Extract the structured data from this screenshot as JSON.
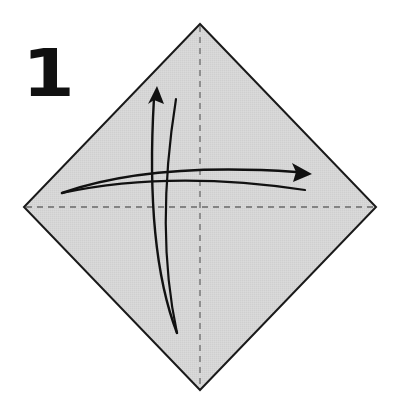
{
  "diagram": {
    "step_number": "1",
    "paper": {
      "shape": "square-diamond",
      "fill": "#d4d4d4",
      "outline": "#1a1a1a",
      "corners": {
        "top": [
          200,
          24
        ],
        "left": [
          24,
          207
        ],
        "right": [
          376,
          207
        ],
        "bottom": [
          200,
          390
        ]
      }
    },
    "creases": [
      {
        "name": "vertical-crease",
        "style": "dashed",
        "color": "#666666",
        "from": [
          200,
          24
        ],
        "to": [
          200,
          390
        ]
      },
      {
        "name": "horizontal-crease",
        "style": "dashed",
        "color": "#666666",
        "from": [
          24,
          207
        ],
        "to": [
          376,
          207
        ]
      }
    ],
    "arrows": [
      {
        "name": "fold-unfold-horizontal-arrow",
        "direction": "left-to-right",
        "meaning": "fold left corner to right corner and unfold"
      },
      {
        "name": "fold-unfold-vertical-arrow",
        "direction": "bottom-to-top",
        "meaning": "fold bottom corner to top corner and unfold"
      }
    ]
  }
}
